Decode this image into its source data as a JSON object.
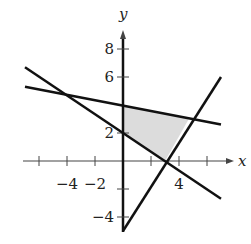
{
  "chart_data": {
    "type": "line",
    "title": "",
    "xlabel": "x",
    "ylabel": "y",
    "xlim": [
      -7,
      8.5
    ],
    "ylim": [
      -5,
      9
    ],
    "x_ticks": [
      -6,
      -4,
      -2,
      2,
      4,
      6
    ],
    "y_ticks": [
      -4,
      -2,
      2,
      6,
      8
    ],
    "x_tick_labels": [
      {
        "v": -4,
        "t": "−4"
      },
      {
        "v": -2,
        "t": "−2"
      },
      {
        "v": 4,
        "t": "4"
      }
    ],
    "y_tick_labels": [
      {
        "v": 8,
        "t": "8"
      },
      {
        "v": 6,
        "t": "6"
      },
      {
        "v": 2,
        "t": "2"
      },
      {
        "v": -4,
        "t": "−4"
      }
    ],
    "series": [
      {
        "name": "line-1",
        "x": [
          -7,
          7
        ],
        "y": [
          5.3,
          2.6
        ]
      },
      {
        "name": "line-2",
        "x": [
          -7,
          7
        ],
        "y": [
          6.7,
          -2.7
        ]
      },
      {
        "name": "line-3",
        "x": [
          0,
          7
        ],
        "y": [
          -5,
          6
        ]
      }
    ],
    "shaded_region": [
      [
        0,
        4
      ],
      [
        4.7,
        3.0
      ],
      [
        3,
        0
      ],
      [
        0,
        2
      ]
    ],
    "shade_color": "#dcdcdc"
  }
}
